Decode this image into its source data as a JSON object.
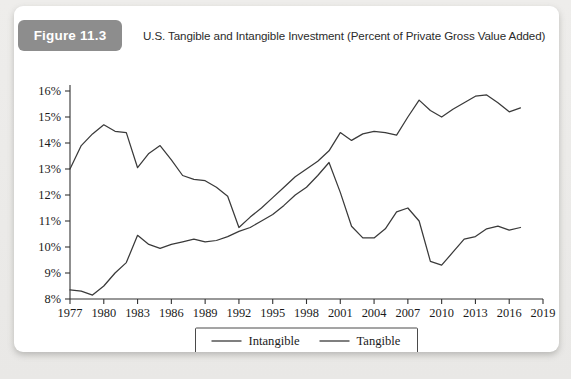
{
  "figure": {
    "badge_label": "Figure 11.3",
    "title": "U.S. Tangible and Intangible Investment (Percent of Private Gross Value Added)"
  },
  "chart_data": {
    "type": "line",
    "title": "U.S. Tangible and Intangible Investment (Percent of Private Gross Value Added)",
    "xlabel": "",
    "ylabel": "",
    "xlim": [
      1977,
      2019
    ],
    "ylim": [
      8,
      16
    ],
    "xticks": [
      1977,
      1980,
      1983,
      1986,
      1989,
      1992,
      1995,
      1998,
      2001,
      2004,
      2007,
      2010,
      2013,
      2016,
      2019
    ],
    "xtick_labels": [
      "1977",
      "1980",
      "1983",
      "1986",
      "1989",
      "1992",
      "1995",
      "1998",
      "2001",
      "2004",
      "2007",
      "2010",
      "2013",
      "2016",
      "2019"
    ],
    "yticks": [
      8,
      9,
      10,
      11,
      12,
      13,
      14,
      15,
      16
    ],
    "ytick_labels": [
      "8%",
      "9%",
      "10%",
      "11%",
      "12%",
      "13%",
      "14%",
      "15%",
      "16%"
    ],
    "grid": false,
    "legend_position": "below-center",
    "x": [
      1977,
      1978,
      1979,
      1980,
      1981,
      1982,
      1983,
      1984,
      1985,
      1986,
      1987,
      1988,
      1989,
      1990,
      1991,
      1992,
      1993,
      1994,
      1995,
      1996,
      1997,
      1998,
      1999,
      2000,
      2001,
      2002,
      2003,
      2004,
      2005,
      2006,
      2007,
      2008,
      2009,
      2010,
      2011,
      2012,
      2013,
      2014,
      2015,
      2016,
      2017
    ],
    "series": [
      {
        "name": "Intangible",
        "color": "#3a3a3a",
        "values": [
          13.0,
          13.9,
          14.35,
          14.7,
          14.45,
          14.4,
          13.05,
          13.6,
          13.9,
          13.35,
          12.75,
          12.6,
          12.55,
          12.3,
          11.95,
          10.75,
          11.15,
          11.5,
          11.9,
          12.3,
          12.7,
          13.0,
          13.3,
          13.7,
          14.4,
          14.1,
          14.35,
          14.45,
          14.4,
          14.3,
          15.0,
          15.65,
          15.25,
          15.0,
          15.3,
          15.55,
          15.8,
          15.85,
          15.55,
          15.2,
          15.35
        ]
      },
      {
        "name": "Tangible",
        "color": "#3a3a3a",
        "values": [
          8.35,
          8.3,
          8.15,
          8.5,
          9.0,
          9.4,
          10.45,
          10.1,
          9.95,
          10.1,
          10.2,
          10.3,
          10.2,
          10.25,
          10.4,
          10.6,
          10.75,
          11.0,
          11.25,
          11.6,
          12.0,
          12.3,
          12.75,
          13.25,
          12.1,
          10.8,
          10.35,
          10.35,
          10.7,
          11.35,
          11.5,
          11.0,
          9.45,
          9.3,
          9.8,
          10.3,
          10.4,
          10.7,
          10.8,
          10.65,
          10.75
        ]
      }
    ],
    "legend": [
      {
        "label": "Intangible"
      },
      {
        "label": "Tangible"
      }
    ]
  }
}
